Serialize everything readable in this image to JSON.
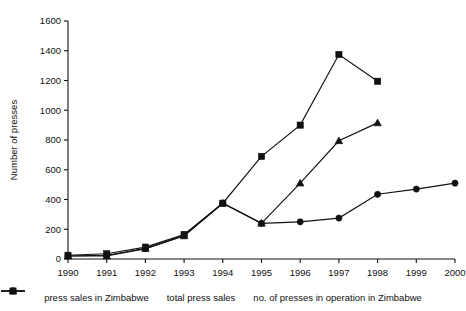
{
  "top_artifact": {
    "text": "· · · · · ·"
  },
  "chart_data": {
    "type": "line",
    "title": "",
    "xlabel": "",
    "ylabel": "Number of presses",
    "xlim": [
      1990,
      2000
    ],
    "ylim": [
      0,
      1600
    ],
    "ytick_step": 200,
    "grid": false,
    "legend_position": "bottom",
    "x": [
      1990,
      1991,
      1992,
      1993,
      1994,
      1995,
      1996,
      1997,
      1998,
      1999,
      2000
    ],
    "xticks": [
      "1990",
      "1991",
      "1992",
      "1993",
      "1994",
      "1995",
      "1996",
      "1997",
      "1998",
      "1999",
      "2000"
    ],
    "yticks": [
      "0",
      "200",
      "400",
      "600",
      "800",
      "1000",
      "1200",
      "1400",
      "1600"
    ],
    "series": [
      {
        "name": "press sales in Zimbabwe",
        "marker": "circle",
        "x": [
          1990,
          1991,
          1992,
          1993,
          1994,
          1995,
          1996,
          1997,
          1998,
          1999,
          2000
        ],
        "values": [
          20,
          25,
          70,
          160,
          375,
          240,
          250,
          275,
          435,
          470,
          510
        ]
      },
      {
        "name": "total press sales",
        "marker": "triangle",
        "x": [
          1990,
          1991,
          1992,
          1993,
          1994,
          1995,
          1996,
          1997,
          1998
        ],
        "values": [
          20,
          20,
          70,
          155,
          375,
          240,
          510,
          795,
          915
        ]
      },
      {
        "name": "no. of presses in operation in Zimbabwe",
        "marker": "square",
        "x": [
          1990,
          1991,
          1992,
          1993,
          1994,
          1995,
          1996,
          1997,
          1998
        ],
        "values": [
          25,
          35,
          80,
          165,
          375,
          690,
          900,
          1375,
          1195
        ]
      }
    ]
  },
  "colors": {
    "ink": "#111111",
    "background": "#ffffff"
  }
}
